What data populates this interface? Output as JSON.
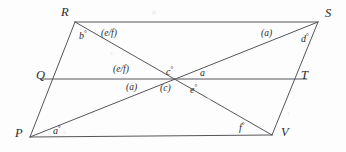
{
  "figure": {
    "stroke_color": "#55565a",
    "background_color": "#fdfdfd",
    "width": 346,
    "height": 152
  },
  "vertices": [
    {
      "name": "R",
      "label": "R",
      "x": 75,
      "y": 22,
      "label_x": 61,
      "label_y": 6
    },
    {
      "name": "S",
      "label": "S",
      "x": 318,
      "y": 22,
      "label_x": 325,
      "label_y": 7
    },
    {
      "name": "Q",
      "label": "Q",
      "x": 52,
      "y": 79,
      "label_x": 36,
      "label_y": 69
    },
    {
      "name": "T",
      "label": "T",
      "x": 295,
      "y": 79,
      "label_x": 301,
      "label_y": 69
    },
    {
      "name": "P",
      "label": "P",
      "x": 30,
      "y": 137,
      "label_x": 15,
      "label_y": 127
    },
    {
      "name": "V",
      "label": "V",
      "x": 272,
      "y": 135,
      "label_x": 281,
      "label_y": 126
    }
  ],
  "segments": [
    {
      "name": "side-RS",
      "x1": 75,
      "y1": 22,
      "x2": 318,
      "y2": 22
    },
    {
      "name": "side-PV",
      "x1": 30,
      "y1": 137,
      "x2": 272,
      "y2": 135
    },
    {
      "name": "side-RP",
      "x1": 75,
      "y1": 22,
      "x2": 30,
      "y2": 137
    },
    {
      "name": "side-SV",
      "x1": 318,
      "y1": 22,
      "x2": 272,
      "y2": 135
    },
    {
      "name": "midline-QT",
      "x1": 40,
      "y1": 79,
      "x2": 307,
      "y2": 79
    },
    {
      "name": "diagonal-RV",
      "x1": 75,
      "y1": 22,
      "x2": 272,
      "y2": 135
    },
    {
      "name": "diagonal-PS",
      "x1": 30,
      "y1": 137,
      "x2": 318,
      "y2": 22
    }
  ],
  "intersection": {
    "name": "center-point",
    "x": 168,
    "y": 78
  },
  "angle_labels": [
    {
      "name": "angle-b-at-R",
      "text": "b",
      "degree": true,
      "paren": false,
      "x": 79,
      "y": 30
    },
    {
      "name": "angle-ef-upper-left",
      "text": "(e/f)",
      "degree": false,
      "paren": true,
      "x": 101,
      "y": 29
    },
    {
      "name": "angle-a-upper-right",
      "text": "(a)",
      "degree": false,
      "paren": true,
      "x": 261,
      "y": 29
    },
    {
      "name": "angle-d-at-S",
      "text": "d",
      "degree": true,
      "paren": false,
      "x": 301,
      "y": 33
    },
    {
      "name": "angle-ef-mid-left",
      "text": "(e/f)",
      "degree": false,
      "paren": true,
      "x": 113,
      "y": 65
    },
    {
      "name": "angle-c-above",
      "text": "c",
      "degree": true,
      "paren": false,
      "x": 166,
      "y": 66
    },
    {
      "name": "angle-a-right",
      "text": "a",
      "degree": false,
      "paren": false,
      "x": 200,
      "y": 68
    },
    {
      "name": "angle-a-mid-left",
      "text": "(a)",
      "degree": false,
      "paren": true,
      "x": 126,
      "y": 83
    },
    {
      "name": "angle-c-below",
      "text": "(c)",
      "degree": false,
      "paren": true,
      "x": 160,
      "y": 84
    },
    {
      "name": "angle-e-below",
      "text": "e",
      "degree": true,
      "paren": false,
      "x": 190,
      "y": 84
    },
    {
      "name": "angle-a-at-P",
      "text": "a",
      "degree": true,
      "paren": false,
      "x": 53,
      "y": 125
    },
    {
      "name": "angle-f-at-V",
      "text": "f",
      "degree": true,
      "paren": false,
      "x": 239,
      "y": 122
    }
  ],
  "speckles": [
    {
      "x": 63,
      "y": 131,
      "w": 3,
      "h": 3
    },
    {
      "x": 152,
      "y": 10,
      "w": 4,
      "h": 5
    },
    {
      "x": 207,
      "y": 97,
      "w": 4,
      "h": 3
    },
    {
      "x": 110,
      "y": 52,
      "w": 3,
      "h": 3
    },
    {
      "x": 287,
      "y": 112,
      "w": 3,
      "h": 3
    }
  ]
}
